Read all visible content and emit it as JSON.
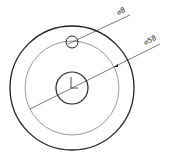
{
  "drawing": {
    "type": "technical-drawing",
    "description": "Circular plate with center hole and bolt-circle hole",
    "dimensions": [
      {
        "label": "⌀8",
        "target": "small hole"
      },
      {
        "label": "⌀58",
        "target": "bolt circle"
      }
    ],
    "colors": {
      "line": "#222222",
      "background": "#ffffff"
    }
  }
}
